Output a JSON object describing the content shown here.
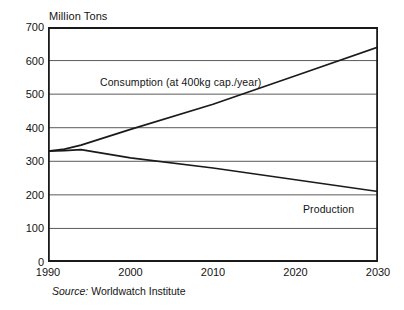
{
  "axis_title": "Million Tons",
  "source": {
    "prefix": "Source:",
    "name": "Worldwatch Institute"
  },
  "labels": {
    "consumption": "Consumption (at 400kg cap./year)",
    "production": "Production"
  },
  "colors": {
    "line": "#1a1a1a",
    "grid": "#5a5a5a",
    "frame": "#1a1a1a",
    "background": "#ffffff",
    "text": "#141414"
  },
  "chart_data": {
    "type": "line",
    "title": "",
    "xlabel": "",
    "ylabel": "Million Tons",
    "xlim": [
      1990,
      2030
    ],
    "ylim": [
      0,
      700
    ],
    "ytick_labels": [
      "700",
      "600",
      "500",
      "400",
      "300",
      "200",
      "100",
      "0"
    ],
    "ytick_values": [
      700,
      600,
      500,
      400,
      300,
      200,
      100,
      0
    ],
    "xtick_labels": [
      "1990",
      "2000",
      "2010",
      "2020",
      "2030"
    ],
    "xtick_values": [
      1990,
      2000,
      2010,
      2020,
      2030
    ],
    "grid": true,
    "grid_axis": "y",
    "legend": "inline-annotations",
    "x": [
      1990,
      1992,
      1994,
      2000,
      2010,
      2020,
      2030
    ],
    "series": [
      {
        "name": "Consumption (at 400kg cap./year)",
        "values": [
          330,
          336,
          348,
          395,
          470,
          555,
          640
        ]
      },
      {
        "name": "Production",
        "values": [
          330,
          332,
          335,
          310,
          280,
          245,
          210
        ]
      }
    ],
    "annotations": [
      {
        "text": "Consumption (at 400kg cap./year)",
        "x": 1996,
        "y": 520
      },
      {
        "text": "Production",
        "x": 2021,
        "y": 165
      }
    ],
    "source": "Source: Worldwatch Institute"
  }
}
